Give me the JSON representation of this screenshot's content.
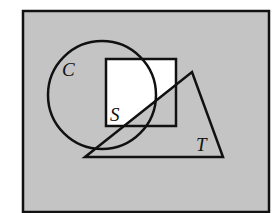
{
  "diagram": {
    "type": "venn-style shaded region diagram",
    "colors": {
      "background_shade": "#c4c4c4",
      "unshaded": "#ffffff",
      "stroke": "#111111"
    },
    "universe": {
      "x": 23,
      "y": 11,
      "width": 246,
      "height": 201
    },
    "shapes": {
      "circle": {
        "label": "C",
        "cx": 102,
        "cy": 95,
        "r": 54,
        "label_pos": [
          62,
          76
        ]
      },
      "square": {
        "label": "S",
        "x": 106,
        "y": 59,
        "width": 70,
        "height": 67,
        "label_pos": [
          110,
          121
        ]
      },
      "triangle": {
        "label": "T",
        "points": [
          [
            85,
            157
          ],
          [
            192,
            72
          ],
          [
            223,
            157
          ]
        ],
        "label_pos": [
          196,
          151
        ]
      }
    },
    "shading": "Everything shaded except the part of square S lying outside triangle T"
  }
}
